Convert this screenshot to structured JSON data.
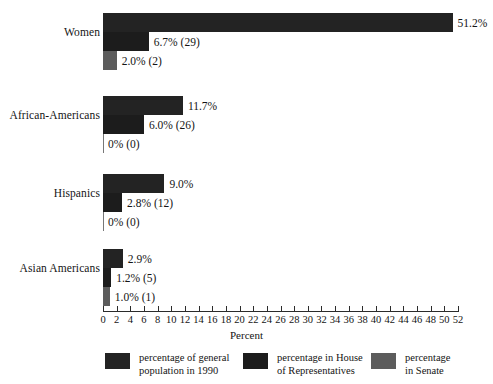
{
  "chart_data": {
    "type": "bar",
    "title": "",
    "orientation": "horizontal",
    "grid": false,
    "legend_position": "bottom",
    "xlabel": "Percent",
    "ylabel": "",
    "xlim": [
      0,
      52
    ],
    "xticks": [
      0,
      2,
      4,
      6,
      8,
      10,
      12,
      14,
      16,
      18,
      20,
      22,
      24,
      26,
      28,
      30,
      32,
      34,
      36,
      38,
      40,
      42,
      44,
      46,
      48,
      50,
      52
    ],
    "categories": [
      "Women",
      "African-Americans",
      "Hispanics",
      "Asian Americans"
    ],
    "series": [
      {
        "name": "percentage of general population in 1990",
        "color": "#232323",
        "values": [
          51.2,
          11.7,
          9.0,
          2.9
        ],
        "labels": [
          "51.2%",
          "11.7%",
          "9.0%",
          "2.9%"
        ]
      },
      {
        "name": "percentage in House of Representatives",
        "color": "#1c1c1c",
        "values": [
          6.7,
          6.0,
          2.8,
          1.2
        ],
        "counts": [
          29,
          26,
          12,
          5
        ],
        "labels": [
          "6.7%  (29)",
          "6.0%  (26)",
          "2.8%  (12)",
          "1.2%  (5)"
        ]
      },
      {
        "name": "percentage in Senate",
        "color": "#5c5c5c",
        "values": [
          2.0,
          0,
          0,
          1.0
        ],
        "counts": [
          2,
          0,
          0,
          1
        ],
        "labels": [
          "2.0%  (2)",
          "0%  (0)",
          "0%  (0)",
          "1.0%  (1)"
        ]
      }
    ]
  },
  "axis": {
    "title": "Percent",
    "tick_labels": [
      "0",
      "2",
      "4",
      "6",
      "8",
      "10",
      "12",
      "14",
      "16",
      "18",
      "20",
      "22",
      "24",
      "26",
      "28",
      "30",
      "32",
      "34",
      "36",
      "38",
      "40",
      "42",
      "44",
      "46",
      "48",
      "50",
      "52"
    ]
  },
  "groups": [
    {
      "label": "Women",
      "bars": [
        {
          "label": "51.2%",
          "value": 51.2,
          "series": 0
        },
        {
          "label": "6.7%  (29)",
          "value": 6.7,
          "series": 1
        },
        {
          "label": "2.0%  (2)",
          "value": 2.0,
          "series": 2
        }
      ]
    },
    {
      "label": "African-Americans",
      "bars": [
        {
          "label": "11.7%",
          "value": 11.7,
          "series": 0
        },
        {
          "label": "6.0%  (26)",
          "value": 6.0,
          "series": 1
        },
        {
          "label": "0%  (0)",
          "value": 0,
          "series": 2
        }
      ]
    },
    {
      "label": "Hispanics",
      "bars": [
        {
          "label": "9.0%",
          "value": 9.0,
          "series": 0
        },
        {
          "label": "2.8%  (12)",
          "value": 2.8,
          "series": 1
        },
        {
          "label": "0%  (0)",
          "value": 0,
          "series": 2
        }
      ]
    },
    {
      "label": "Asian Americans",
      "bars": [
        {
          "label": "2.9%",
          "value": 2.9,
          "series": 0
        },
        {
          "label": "1.2%  (5)",
          "value": 1.2,
          "series": 1
        },
        {
          "label": "1.0%  (1)",
          "value": 1.0,
          "series": 2
        }
      ]
    }
  ],
  "legend": [
    {
      "text": "percentage of general\npopulation in 1990",
      "color": "#232323"
    },
    {
      "text": "percentage in House\nof Representatives",
      "color": "#1c1c1c"
    },
    {
      "text": "percentage\nin Senate",
      "color": "#5c5c5c"
    }
  ]
}
